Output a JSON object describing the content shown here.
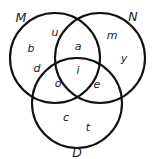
{
  "figure": {
    "type": "venn-diagram-3-set",
    "background_color": "#ffffff",
    "stroke_color": "#111111",
    "text_color": "#1a1a1a"
  },
  "sets": [
    {
      "name": "set-m",
      "label": "M",
      "x": 21,
      "y": 18
    },
    {
      "name": "set-n",
      "label": "N",
      "x": 133,
      "y": 17
    },
    {
      "name": "set-d",
      "label": "D",
      "x": 77,
      "y": 153
    }
  ],
  "circles": [
    {
      "name": "circle-m",
      "cx": 55,
      "cy": 58,
      "r": 45
    },
    {
      "name": "circle-n",
      "cx": 100,
      "cy": 58,
      "r": 45
    },
    {
      "name": "circle-d",
      "cx": 77,
      "cy": 103,
      "r": 45
    }
  ],
  "regions": [
    {
      "name": "region-m-only-u",
      "label": "u",
      "x": 55,
      "y": 32
    },
    {
      "name": "region-m-only-b",
      "label": "b",
      "x": 31,
      "y": 48
    },
    {
      "name": "region-m-only-d",
      "label": "d",
      "x": 37,
      "y": 68
    },
    {
      "name": "region-n-only-m",
      "label": "m",
      "x": 112,
      "y": 35
    },
    {
      "name": "region-n-only-y",
      "label": "y",
      "x": 124,
      "y": 58
    },
    {
      "name": "region-m-and-n",
      "label": "a",
      "x": 78,
      "y": 46
    },
    {
      "name": "region-m-and-n-and-d",
      "label": "i",
      "x": 78,
      "y": 70
    },
    {
      "name": "region-m-and-d",
      "label": "o",
      "x": 58,
      "y": 83
    },
    {
      "name": "region-n-and-d",
      "label": "e",
      "x": 97,
      "y": 84
    },
    {
      "name": "region-d-only-c",
      "label": "c",
      "x": 66,
      "y": 117
    },
    {
      "name": "region-d-only-t",
      "label": "t",
      "x": 88,
      "y": 127
    }
  ]
}
